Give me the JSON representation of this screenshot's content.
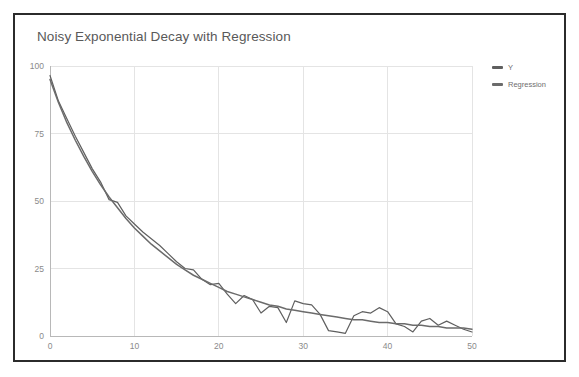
{
  "card": {
    "border_color": "#2b2b2b",
    "background": "#ffffff"
  },
  "chart_data": {
    "type": "line",
    "title": "Noisy Exponential Decay with Regression",
    "xlabel": "",
    "ylabel": "",
    "xlim": [
      0,
      50
    ],
    "ylim": [
      0,
      100
    ],
    "grid": true,
    "legend_position": "right",
    "xticks": [
      0,
      10,
      20,
      30,
      40,
      50
    ],
    "yticks": [
      0,
      25,
      50,
      75,
      100
    ],
    "x": [
      0,
      1,
      2,
      3,
      4,
      5,
      6,
      7,
      8,
      9,
      10,
      11,
      12,
      13,
      14,
      15,
      16,
      17,
      18,
      19,
      20,
      21,
      22,
      23,
      24,
      25,
      26,
      27,
      28,
      29,
      30,
      31,
      32,
      33,
      34,
      35,
      36,
      37,
      38,
      39,
      40,
      41,
      42,
      43,
      44,
      45,
      46,
      47,
      48,
      49,
      50
    ],
    "series": [
      {
        "name": "Y",
        "color": "#5f5f5f",
        "values": [
          96.5,
          87.0,
          80.5,
          74.0,
          68.0,
          62.0,
          57.0,
          50.5,
          49.5,
          44.5,
          41.5,
          38.5,
          36.0,
          33.5,
          30.5,
          27.5,
          25.0,
          24.5,
          21.0,
          19.0,
          19.5,
          15.5,
          12.0,
          15.0,
          13.5,
          8.5,
          11.0,
          10.5,
          5.0,
          13.0,
          12.0,
          11.5,
          8.0,
          2.0,
          1.5,
          1.0,
          7.5,
          9.0,
          8.5,
          10.5,
          9.0,
          4.5,
          3.5,
          1.5,
          5.5,
          6.5,
          4.0,
          5.5,
          4.0,
          2.5,
          1.5
        ]
      },
      {
        "name": "Regression",
        "color": "#6b6b6b",
        "values": [
          95.0,
          86.5,
          79.0,
          72.5,
          66.5,
          61.0,
          56.0,
          51.5,
          47.5,
          43.5,
          40.0,
          37.0,
          34.0,
          31.5,
          29.0,
          26.5,
          24.5,
          22.5,
          21.0,
          19.5,
          18.0,
          16.5,
          15.5,
          14.5,
          13.5,
          12.5,
          11.5,
          11.0,
          10.0,
          9.5,
          9.0,
          8.5,
          8.0,
          7.5,
          7.0,
          6.5,
          6.0,
          6.0,
          5.5,
          5.0,
          5.0,
          4.5,
          4.5,
          4.0,
          4.0,
          3.5,
          3.5,
          3.0,
          3.0,
          3.0,
          2.5
        ]
      }
    ]
  }
}
